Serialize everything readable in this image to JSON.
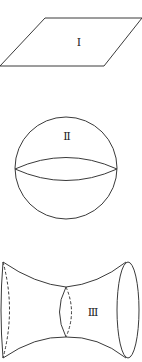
{
  "figures": [
    {
      "id": "plane",
      "shape": "parallelogram",
      "label": "Ⅰ"
    },
    {
      "id": "sphere",
      "shape": "sphere",
      "label": "Ⅱ"
    },
    {
      "id": "hyperboloid",
      "shape": "hyperboloid",
      "label": "Ⅲ"
    }
  ],
  "colors": {
    "line": "#3a3a3a",
    "background": "#ffffff"
  }
}
